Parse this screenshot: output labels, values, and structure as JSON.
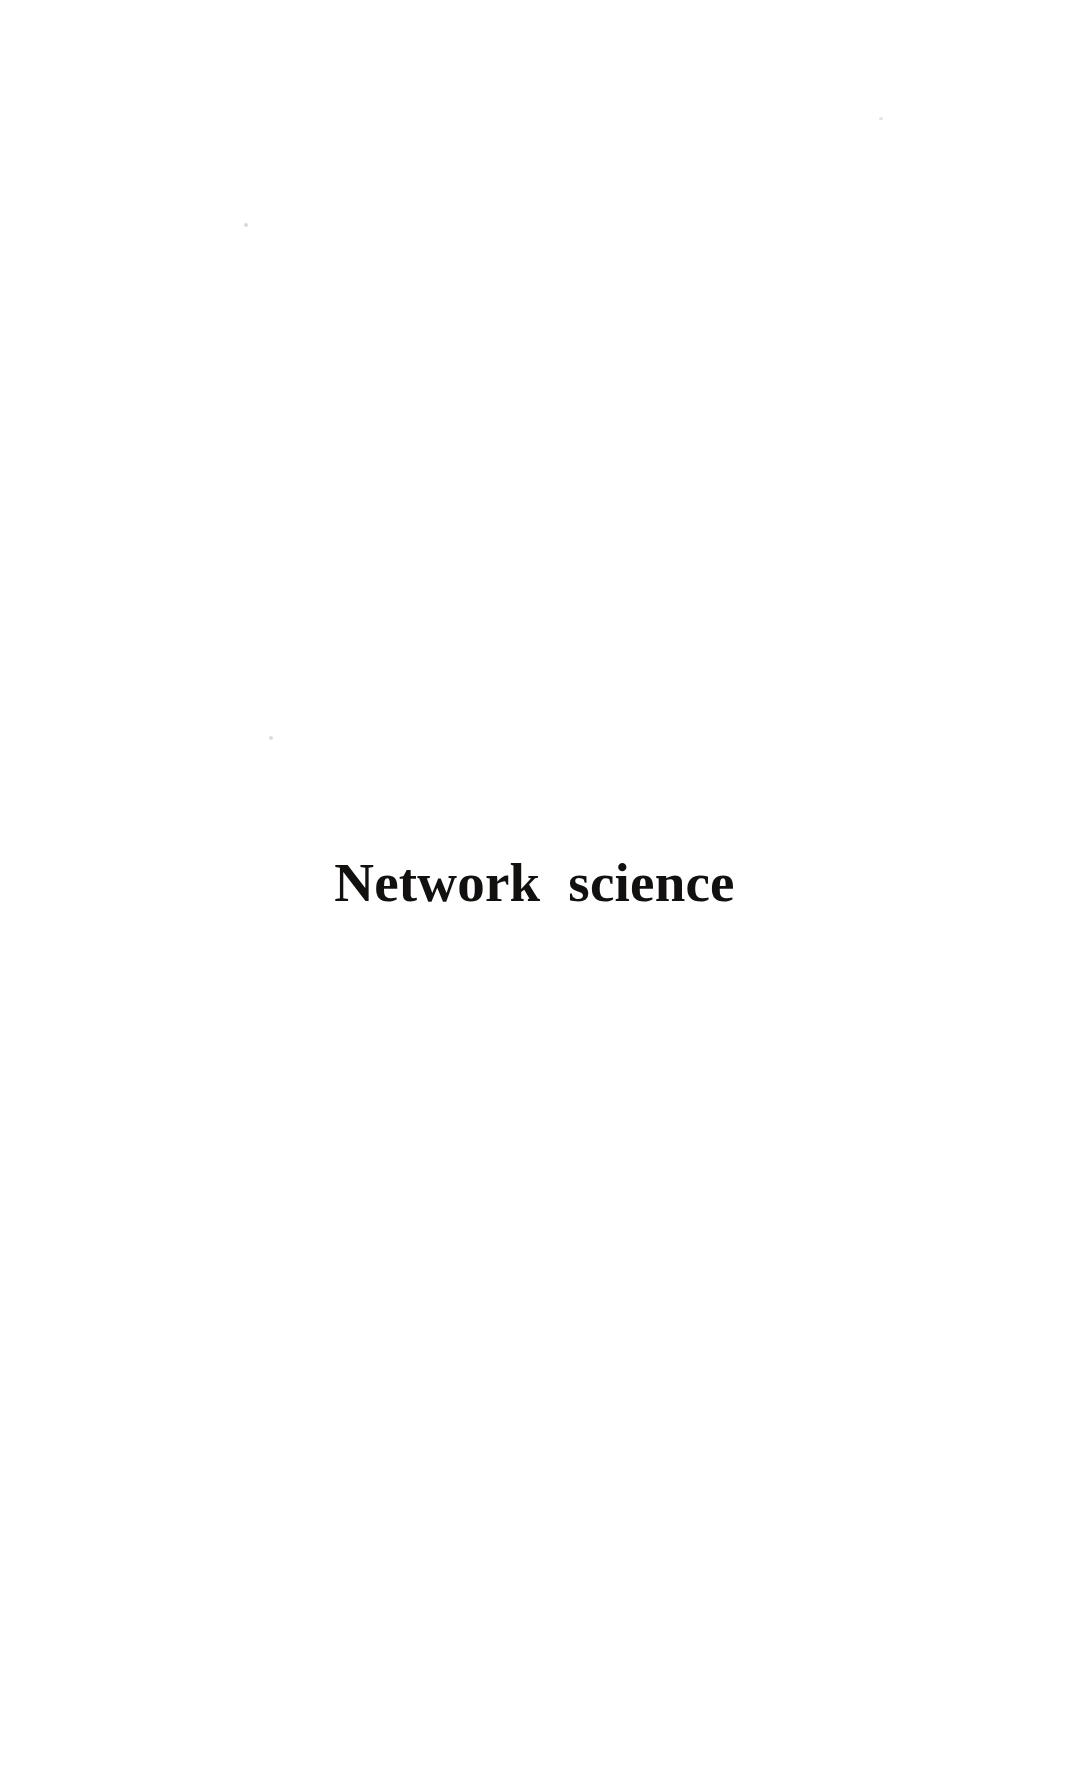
{
  "page": {
    "kind": "half-title-page",
    "background_color": "#ffffff",
    "text_color": "#13110f",
    "width": 1069,
    "height": 1772
  },
  "title": {
    "text": "Network science"
  },
  "artifacts": {
    "speck_top_left": "scan-speck",
    "speck_top_right": "scan-speck",
    "speck_mid_left": "scan-speck"
  }
}
